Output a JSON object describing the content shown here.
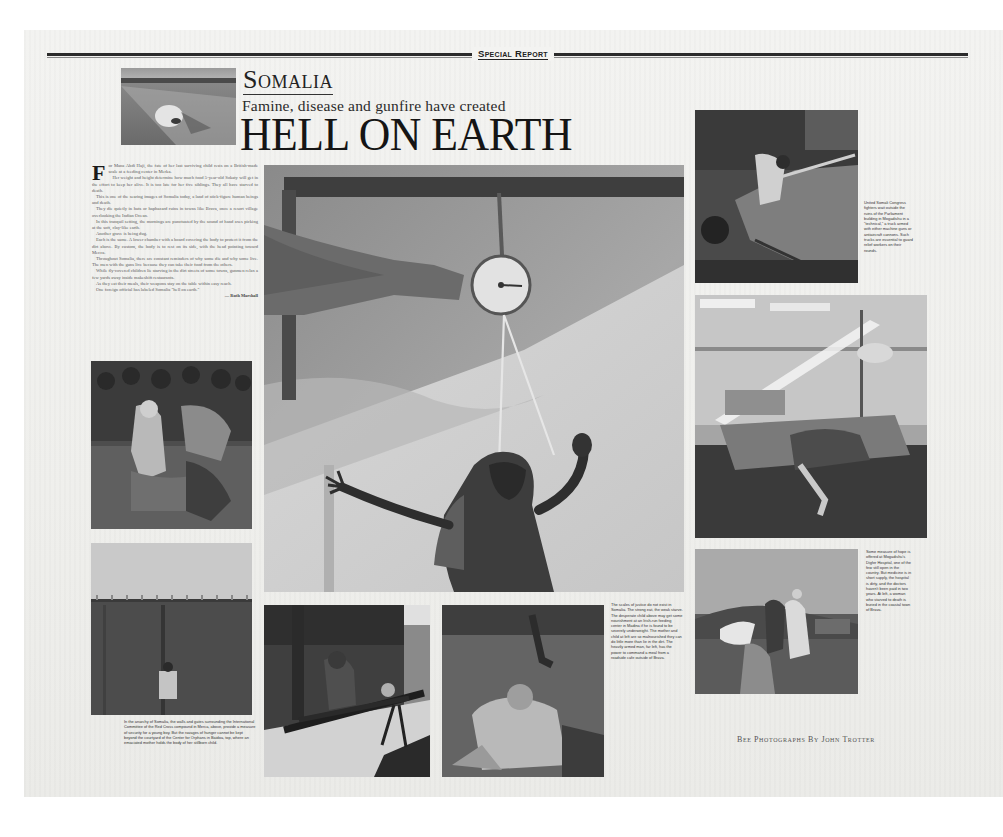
{
  "page": {
    "section_flag": "Special Report"
  },
  "header": {
    "kicker": "Somalia",
    "deck": "Famine, disease and gunfire have created",
    "headline": "HELL ON EARTH"
  },
  "article": {
    "drop_cap": "F",
    "paragraphs": [
      "or Mana Abdi Haji, the fate of her last surviving child rests on a British-made scale at a feeding center in Merka.",
      "Her weight and height determine how much food 5-year-old Sokaty will get in the effort to keep her alive. It is too late for her five siblings. They all have starved to death.",
      "This is one of the searing images of Somalia today, a land of stick-figure human beings and death.",
      "They die quietly in huts or haphazard ruins in towns like Brava, once a resort village overlooking the Indian Ocean.",
      "In this tranquil setting, the mornings are punctuated by the sound of hand axes picking at the soft, clay-like earth.",
      "Another grave is being dug.",
      "Each is the same. A lower chamber with a board covering the body to protect it from the dirt above. By custom, the body is to rest on its side, with the head pointing toward Mecca.",
      "Throughout Somalia, there are constant reminders of why some die and why some live. The men with the guns live because they can take their food from the others.",
      "While fly-covered children lie starving in the dirt streets of some towns, gunmen relax a few yards away inside makeshift restaurants.",
      "As they eat their meals, their weapons stay on the table within easy reach.",
      "One foreign official has labeled Somalia \"hell on earth.\""
    ],
    "byline": "— Ruth Marshall"
  },
  "photos": [
    {
      "id": "skull",
      "subject": "skull on barren ground"
    },
    {
      "id": "scale",
      "subject": "child hanging from a weighing scale"
    },
    {
      "id": "crowd",
      "subject": "crowd and starving child at feeding center"
    },
    {
      "id": "gate",
      "subject": "child standing at walled compound gate"
    },
    {
      "id": "gunner",
      "subject": "boy manning a mounted machine gun"
    },
    {
      "id": "woman",
      "subject": "woman kneeling with child on ground"
    },
    {
      "id": "technical",
      "subject": "armed fighters on a technical truck"
    },
    {
      "id": "hospital",
      "subject": "patients in hospital ward with shaft of light"
    },
    {
      "id": "burial",
      "subject": "men carrying a shrouded body"
    }
  ],
  "captions": {
    "gate": "In the anarchy of Somalia, the walls and gates surrounding the International Committee of the Red Cross compound in Merca, above, provide a measure of security for a young boy. But the ravages of hunger cannot be kept beyond the courtyard of the Center for Orphans in Baidoa, top, where an emaciated mother holds the body of her stillborn child.",
    "woman": "The scales of justice do not exist in Somalia. The strong eat, the weak starve. The desperate child above may get some nourishment at an Irish-run feeding center in Madina if he is found to be severely underweight. The mother and child at left are so malnourished they can do little more than lie in the dirt. The heavily armed man, far left, has the power to command a meal from a roadside cafe outside of Brava.",
    "technical": "United Somali Congress fighters wait outside the ruins of the Parliament building in Mogadishu in a \"technical,\" a truck armed with either machine guns or antiaircraft cannons. Such trucks are essential to guard relief workers on their rounds.",
    "burial": "Some measure of hope is offered at Mogadishu's Digfer Hospital, one of the few still open in the country. But medicine is in short supply, the hospital is dirty, and the doctors haven't been paid in two years. At left, a woman who starved to death is buried in the coastal town of Brava."
  },
  "credit": "Bee Photographs By John Trotter"
}
